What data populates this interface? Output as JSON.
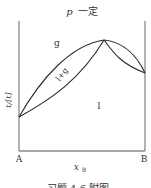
{
  "title": {
    "var": "p",
    "text": "一定"
  },
  "axes": {
    "ylabel": "t/[t]",
    "xlabel_main": "x",
    "xlabel_sub": "B",
    "left_end": "A",
    "right_end": "B"
  },
  "regions": {
    "gas": "g",
    "two_phase": "l+g",
    "liquid": "l"
  },
  "caption": "习题 4-6 附图",
  "colors": {
    "curve": "#2a2a2a",
    "axis": "#8a8a8a",
    "text": "#333333"
  }
}
